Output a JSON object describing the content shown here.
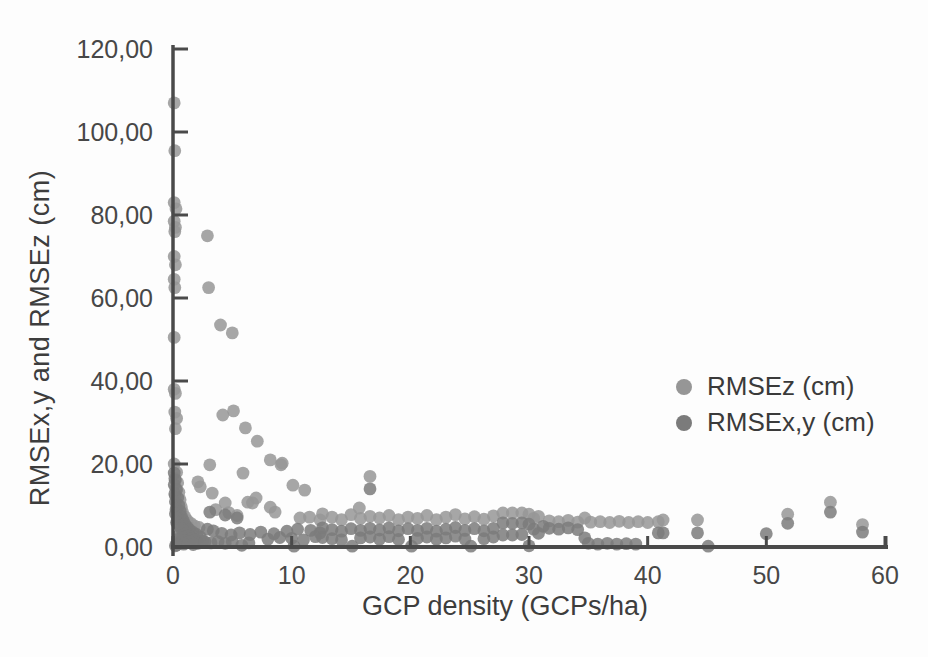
{
  "chart_data": {
    "type": "scatter",
    "title": "",
    "xlabel": "GCP density (GCPs/ha)",
    "ylabel": "RMSEx,y and RMSEz (cm)",
    "xlim": [
      0,
      60
    ],
    "ylim": [
      0,
      120
    ],
    "x_ticks": [
      0,
      10,
      20,
      30,
      40,
      50,
      60
    ],
    "x_tick_labels": [
      "0",
      "10",
      "20",
      "30",
      "40",
      "50",
      "60"
    ],
    "y_ticks": [
      0,
      20,
      40,
      60,
      80,
      100,
      120
    ],
    "y_tick_labels": [
      "0,00",
      "20,00",
      "40,00",
      "60,00",
      "80,00",
      "100,00",
      "120,00"
    ],
    "grid": false,
    "legend_position": "right-middle",
    "axis_color": "#4a4a4a",
    "series": [
      {
        "name": "RMSEz (cm)",
        "color": "#969696",
        "points": [
          [
            0.1,
            107
          ],
          [
            0.15,
            95.5
          ],
          [
            0.1,
            83
          ],
          [
            0.25,
            81.5
          ],
          [
            0.1,
            78.5
          ],
          [
            0.2,
            77
          ],
          [
            0.15,
            76
          ],
          [
            0.1,
            70
          ],
          [
            0.2,
            68
          ],
          [
            0.1,
            64.5
          ],
          [
            0.15,
            62.5
          ],
          [
            0.1,
            50.5
          ],
          [
            0.1,
            38
          ],
          [
            0.2,
            37
          ],
          [
            0.15,
            32.5
          ],
          [
            0.3,
            31
          ],
          [
            0.2,
            28.5
          ],
          [
            0.1,
            20
          ],
          [
            0.3,
            18
          ],
          [
            0.15,
            16.5
          ],
          [
            0.4,
            15.5
          ],
          [
            0.25,
            14.2
          ],
          [
            0.5,
            13.2
          ],
          [
            0.2,
            12.3
          ],
          [
            0.6,
            11.4
          ],
          [
            0.35,
            10.5
          ],
          [
            0.7,
            9.7
          ],
          [
            0.25,
            9
          ],
          [
            0.8,
            8.4
          ],
          [
            0.5,
            7.8
          ],
          [
            1,
            7.3
          ],
          [
            0.65,
            6.8
          ],
          [
            1.2,
            6.4
          ],
          [
            0.85,
            6
          ],
          [
            1.5,
            5.7
          ],
          [
            1.1,
            5.4
          ],
          [
            1.8,
            5.1
          ],
          [
            1.35,
            4.9
          ],
          [
            2.2,
            4.7
          ],
          [
            1.6,
            4.5
          ],
          [
            2.9,
            75
          ],
          [
            3,
            62.5
          ],
          [
            4,
            53.5
          ],
          [
            5,
            51.6
          ],
          [
            4.2,
            31.8
          ],
          [
            5.1,
            32.8
          ],
          [
            6.1,
            28.7
          ],
          [
            7.1,
            25.5
          ],
          [
            8.2,
            21
          ],
          [
            9.2,
            20.2
          ],
          [
            9.1,
            19.8
          ],
          [
            3.1,
            19.8
          ],
          [
            5.9,
            17.8
          ],
          [
            2.1,
            15.7
          ],
          [
            2.3,
            14.5
          ],
          [
            10.1,
            14.9
          ],
          [
            11.1,
            13.7
          ],
          [
            16.6,
            17
          ],
          [
            3.3,
            13
          ],
          [
            4.4,
            10.6
          ],
          [
            6.3,
            10.8
          ],
          [
            6.7,
            10.6
          ],
          [
            7,
            11.8
          ],
          [
            8.2,
            9.6
          ],
          [
            8.6,
            8.4
          ],
          [
            10.7,
            7
          ],
          [
            11.5,
            7.2
          ],
          [
            12.4,
            6.5
          ],
          [
            15.7,
            9.4
          ],
          [
            3.6,
            9
          ],
          [
            4.7,
            8.3
          ],
          [
            5.4,
            7.6
          ],
          [
            12.6,
            8
          ],
          [
            13.4,
            7.2
          ],
          [
            14.2,
            6.6
          ],
          [
            15,
            7.8
          ],
          [
            15.8,
            6.9
          ],
          [
            16.6,
            7.4
          ],
          [
            17.4,
            7
          ],
          [
            18.2,
            7.6
          ],
          [
            19,
            6.6
          ],
          [
            19.8,
            7.2
          ],
          [
            20.6,
            6.9
          ],
          [
            21.4,
            7.6
          ],
          [
            22.2,
            6.6
          ],
          [
            23,
            7.2
          ],
          [
            23.8,
            7.8
          ],
          [
            24.6,
            6.8
          ],
          [
            25.4,
            7.3
          ],
          [
            26.2,
            6.7
          ],
          [
            27,
            7.5
          ],
          [
            27.8,
            8.2
          ],
          [
            28.6,
            8.2
          ],
          [
            29.4,
            8.2
          ],
          [
            30,
            7.9
          ],
          [
            30.4,
            6.9
          ],
          [
            30.8,
            7.4
          ],
          [
            31.7,
            6.3
          ],
          [
            32.5,
            6.1
          ],
          [
            33.3,
            6.4
          ],
          [
            34.1,
            6
          ],
          [
            34.7,
            7
          ],
          [
            35.2,
            6
          ],
          [
            36,
            6.1
          ],
          [
            36.8,
            5.9
          ],
          [
            37.6,
            6.2
          ],
          [
            38.4,
            5.9
          ],
          [
            39.2,
            6.1
          ],
          [
            40,
            5.9
          ],
          [
            40.9,
            6.1
          ],
          [
            41.3,
            6.5
          ],
          [
            44.2,
            6.5
          ],
          [
            51.8,
            7.9
          ],
          [
            55.4,
            10.8
          ],
          [
            58.1,
            5.4
          ]
        ]
      },
      {
        "name": "RMSEx,y (cm)",
        "color": "#7b7b7b",
        "points": [
          [
            0.1,
            17.8
          ],
          [
            0.2,
            16.2
          ],
          [
            0.1,
            15
          ],
          [
            0.3,
            13.8
          ],
          [
            0.15,
            12.8
          ],
          [
            0.4,
            11.8
          ],
          [
            0.2,
            10.9
          ],
          [
            0.5,
            10
          ],
          [
            0.3,
            9.3
          ],
          [
            0.6,
            8.6
          ],
          [
            0.2,
            8
          ],
          [
            0.7,
            7.4
          ],
          [
            0.4,
            6.9
          ],
          [
            0.85,
            6.4
          ],
          [
            0.3,
            5.9
          ],
          [
            1,
            5.5
          ],
          [
            0.55,
            5.1
          ],
          [
            1.2,
            4.8
          ],
          [
            0.7,
            4.4
          ],
          [
            1.4,
            4.1
          ],
          [
            0.9,
            3.8
          ],
          [
            1.7,
            3.5
          ],
          [
            1.1,
            3.2
          ],
          [
            2,
            3
          ],
          [
            0.5,
            2.8
          ],
          [
            1.3,
            2.6
          ],
          [
            2.3,
            2.4
          ],
          [
            0.8,
            2.2
          ],
          [
            1.6,
            2
          ],
          [
            0.4,
            1.8
          ],
          [
            1.9,
            1.7
          ],
          [
            1,
            1.5
          ],
          [
            2.5,
            1.4
          ],
          [
            1.4,
            1.2
          ],
          [
            0.6,
            1.1
          ],
          [
            2.1,
            0.9
          ],
          [
            0.9,
            0.7
          ],
          [
            1.7,
            0.6
          ],
          [
            0.3,
            0.5
          ],
          [
            0.2,
            0.3
          ],
          [
            2.7,
            1.2
          ],
          [
            3.2,
            1
          ],
          [
            3.8,
            1.3
          ],
          [
            4.4,
            0.9
          ],
          [
            5,
            1.2
          ],
          [
            6.4,
            1
          ],
          [
            8,
            1.9
          ],
          [
            9,
            2.3
          ],
          [
            10,
            2.1
          ],
          [
            11,
            1.7
          ],
          [
            12,
            2.5
          ],
          [
            2.9,
            4.3
          ],
          [
            3.4,
            3.9
          ],
          [
            4.1,
            3.3
          ],
          [
            4.9,
            2.9
          ],
          [
            5.6,
            3.4
          ],
          [
            6.5,
            3
          ],
          [
            7.4,
            3.6
          ],
          [
            8.5,
            3.2
          ],
          [
            9.6,
            3.8
          ],
          [
            10.5,
            4.3
          ],
          [
            11.6,
            4
          ],
          [
            12.4,
            3.4
          ],
          [
            3.1,
            8.4
          ],
          [
            4.4,
            7.7
          ],
          [
            5.4,
            7
          ],
          [
            16.6,
            14
          ],
          [
            12.6,
            4.6
          ],
          [
            12.6,
            2.3
          ],
          [
            13.4,
            4.2
          ],
          [
            13.4,
            2
          ],
          [
            14.2,
            3.8
          ],
          [
            14.2,
            1.7
          ],
          [
            15,
            4.4
          ],
          [
            15.8,
            4
          ],
          [
            15.8,
            2.2
          ],
          [
            16.6,
            4.5
          ],
          [
            16.6,
            2.4
          ],
          [
            17.4,
            4.1
          ],
          [
            17.4,
            1.9
          ],
          [
            18.2,
            4.6
          ],
          [
            18.2,
            2.5
          ],
          [
            19,
            3.9
          ],
          [
            19,
            1.8
          ],
          [
            19.8,
            4.4
          ],
          [
            20.6,
            4
          ],
          [
            20.6,
            2.1
          ],
          [
            21.4,
            4.5
          ],
          [
            21.4,
            2.4
          ],
          [
            22.2,
            3.8
          ],
          [
            22.2,
            1.9
          ],
          [
            23,
            4.3
          ],
          [
            23,
            2.2
          ],
          [
            23.8,
            4.7
          ],
          [
            23.8,
            2.6
          ],
          [
            24.6,
            4
          ],
          [
            24.6,
            1.9
          ],
          [
            25.4,
            4.4
          ],
          [
            26.2,
            3.9
          ],
          [
            26.2,
            2
          ],
          [
            27,
            4.5
          ],
          [
            27,
            2.4
          ],
          [
            27.8,
            5.8
          ],
          [
            27.8,
            2.9
          ],
          [
            28.6,
            5.7
          ],
          [
            28.6,
            2.9
          ],
          [
            29.4,
            5.8
          ],
          [
            29.4,
            3
          ],
          [
            30,
            5.5
          ],
          [
            30.4,
            4.3
          ],
          [
            30.8,
            3.3
          ],
          [
            31.2,
            5
          ],
          [
            31.7,
            4.5
          ],
          [
            32.5,
            4.3
          ],
          [
            33.3,
            4.6
          ],
          [
            34.1,
            4.2
          ],
          [
            34.7,
            2.2
          ],
          [
            40.9,
            3.4
          ],
          [
            41.3,
            3.4
          ],
          [
            5.8,
            0.4
          ],
          [
            10.2,
            0.2
          ],
          [
            15.1,
            0.2
          ],
          [
            20.1,
            0.2
          ],
          [
            25.1,
            0.2
          ],
          [
            30,
            0.3
          ],
          [
            35,
            0.9
          ],
          [
            35.8,
            0.7
          ],
          [
            36.6,
            0.9
          ],
          [
            37.4,
            0.7
          ],
          [
            38.2,
            0.8
          ],
          [
            39,
            0.7
          ],
          [
            45.1,
            0.2
          ],
          [
            44.2,
            3.4
          ],
          [
            50,
            3.2
          ],
          [
            51.8,
            5.7
          ],
          [
            55.4,
            8.4
          ],
          [
            58.1,
            3.6
          ]
        ]
      }
    ]
  }
}
